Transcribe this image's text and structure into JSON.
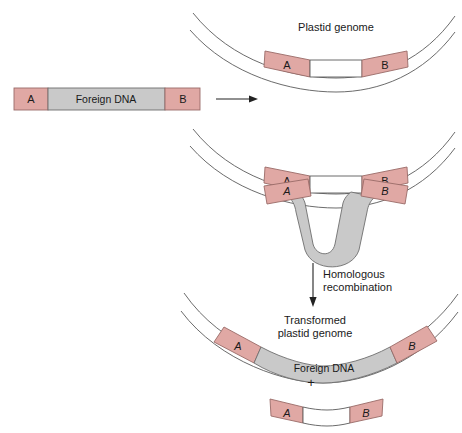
{
  "figure": {
    "title_top": "Plastid genome",
    "title_bottom_line1": "Transformed",
    "title_bottom_line2": "plastid genome",
    "arrow_label_line1": "Homologous",
    "arrow_label_line2": "recombination",
    "plus_sign": "+",
    "colors": {
      "homology_block": "#e0a8a4",
      "homology_block_stroke": "#9a6b68",
      "foreign_dna": "#c9c9c9",
      "foreign_dna_stroke": "#6e6e6e",
      "genome_line": "#5a5a5a",
      "text": "#1a1a1a",
      "background": "#ffffff"
    },
    "construct": {
      "block_a_label": "A",
      "foreign_label": "Foreign DNA",
      "block_b_label": "B"
    },
    "genome_top": {
      "block_a_label": "A",
      "block_b_label": "B"
    },
    "pairing": {
      "genome_block_a_label": "A",
      "genome_block_b_label": "B",
      "construct_block_a_label": "A",
      "construct_block_b_label": "B"
    },
    "transformed": {
      "block_a_label": "A",
      "foreign_label": "Foreign DNA",
      "block_b_label": "B"
    },
    "excised": {
      "block_a_label": "A",
      "block_b_label": "B"
    }
  }
}
